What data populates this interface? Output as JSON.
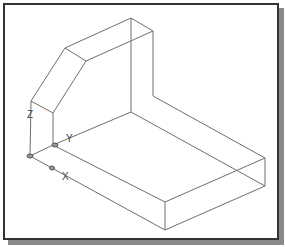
{
  "viewport": {
    "background": "#ffffff",
    "frame_border": "#333333",
    "shadow": "#8a8a8a",
    "line_color": "#6e6e6e"
  },
  "ucs_icon": {
    "z_label": "Z",
    "y_label": "Y",
    "x_label": "X"
  },
  "model": {
    "description": "Isometric wireframe of an L-shaped solid with a chamfered upright"
  }
}
